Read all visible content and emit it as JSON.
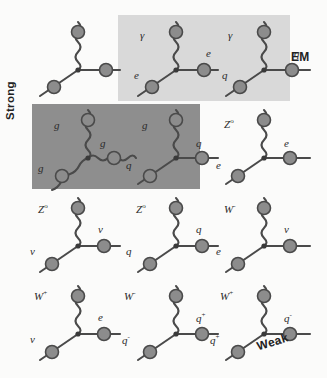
{
  "figure": {
    "background_color": "#fbfbfa",
    "line_color": "#4a4a4a",
    "node_color": "#8c8c8c",
    "node_stroke": "#4a4a4a"
  },
  "panels": {
    "em": {
      "label": "EM",
      "color": "#d9d9d9",
      "x": 118,
      "y": 15,
      "width": 172,
      "height": 86
    },
    "strong": {
      "label": "Strong",
      "color": "#8e8e8e",
      "x": 32,
      "y": 104,
      "width": 168,
      "height": 85
    },
    "weak": {
      "label": "Weak",
      "color": "#fbfbfa"
    }
  },
  "diagrams": [
    {
      "id": "generic-vertex",
      "row": 1,
      "col": 1,
      "boson_line": "wavy",
      "labels": {
        "boson": "",
        "incoming": "",
        "outgoing": ""
      }
    },
    {
      "id": "em-electron",
      "row": 1,
      "col": 2,
      "boson_line": "wavy",
      "labels": {
        "boson": "γ",
        "incoming": "e",
        "outgoing": "e"
      }
    },
    {
      "id": "em-quark",
      "row": 1,
      "col": 3,
      "boson_line": "wavy",
      "labels": {
        "boson": "γ",
        "incoming": "q",
        "outgoing": "q"
      }
    },
    {
      "id": "strong-gluon-self",
      "row": 2,
      "col": 1,
      "boson_line": "wavy",
      "labels": {
        "boson": "g",
        "incoming": "g",
        "outgoing": "g"
      }
    },
    {
      "id": "strong-quark",
      "row": 2,
      "col": 2,
      "boson_line": "wavy",
      "labels": {
        "boson": "g",
        "incoming": "q",
        "outgoing": "q"
      }
    },
    {
      "id": "weak-z-electron",
      "row": 2,
      "col": 3,
      "boson_line": "wavy",
      "labels": {
        "boson": "Z⁰",
        "incoming": "e",
        "outgoing": "e"
      }
    },
    {
      "id": "weak-z-neutrino",
      "row": 3,
      "col": 1,
      "boson_line": "wavy",
      "labels": {
        "boson": "Z⁰",
        "incoming": "ν",
        "outgoing": "ν"
      }
    },
    {
      "id": "weak-z-quark",
      "row": 3,
      "col": 2,
      "boson_line": "wavy",
      "labels": {
        "boson": "Z⁰",
        "incoming": "q",
        "outgoing": "q"
      }
    },
    {
      "id": "weak-w-electron-neutrino",
      "row": 3,
      "col": 3,
      "boson_line": "wavy",
      "labels": {
        "boson": "W⁻",
        "incoming": "e",
        "outgoing": "ν"
      }
    },
    {
      "id": "weak-w-neutrino-electron",
      "row": 4,
      "col": 1,
      "boson_line": "wavy",
      "labels": {
        "boson": "W⁺",
        "incoming": "ν",
        "outgoing": "e"
      }
    },
    {
      "id": "weak-w-quark-minus",
      "row": 4,
      "col": 2,
      "boson_line": "wavy",
      "labels": {
        "boson": "W⁻",
        "incoming": "q⁻",
        "outgoing": "q⁺"
      }
    },
    {
      "id": "weak-w-quark-plus",
      "row": 4,
      "col": 3,
      "boson_line": "wavy",
      "labels": {
        "boson": "W⁺",
        "incoming": "q⁺",
        "outgoing": "q⁻"
      }
    }
  ],
  "labels": {
    "row1": {
      "d1_boson": "",
      "d1_in": "",
      "d1_out": "",
      "d2_boson": "γ",
      "d2_in": "e",
      "d2_out": "e",
      "d3_boson": "γ",
      "d3_in": "q",
      "d3_out": "q"
    },
    "row2": {
      "d1_boson": "g",
      "d1_in": "g",
      "d1_out": "g",
      "d2_boson": "g",
      "d2_in": "q",
      "d2_out": "q",
      "d3_boson": "Z",
      "d3_boson_sup": "o",
      "d3_in": "e",
      "d3_out": "e"
    },
    "row3": {
      "d1_boson": "Z",
      "d1_boson_sup": "o",
      "d1_in": "ν",
      "d1_out": "ν",
      "d2_boson": "Z",
      "d2_boson_sup": "o",
      "d2_in": "q",
      "d2_out": "q",
      "d3_boson": "W",
      "d3_boson_sup": "-",
      "d3_in": "e",
      "d3_out": "ν"
    },
    "row4": {
      "d1_boson": "W",
      "d1_boson_sup": "+",
      "d1_in": "ν",
      "d1_out": "e",
      "d2_boson": "W",
      "d2_boson_sup": "-",
      "d2_in": "q",
      "d2_in_sup": "-",
      "d2_out": "q",
      "d2_out_sup": "+",
      "d3_boson": "W",
      "d3_boson_sup": "+",
      "d3_in": "q",
      "d3_in_sup": "+",
      "d3_out": "q",
      "d3_out_sup": "-"
    }
  },
  "force_labels": {
    "em": "EM",
    "strong": "Strong",
    "weak": "Weak"
  }
}
